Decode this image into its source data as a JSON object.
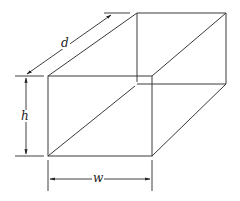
{
  "diagram": {
    "type": "rectangular-prism",
    "colors": {
      "line": "#3a3a3a",
      "background": "#ffffff"
    },
    "labels": {
      "depth": "d",
      "height": "h",
      "width": "w"
    }
  }
}
